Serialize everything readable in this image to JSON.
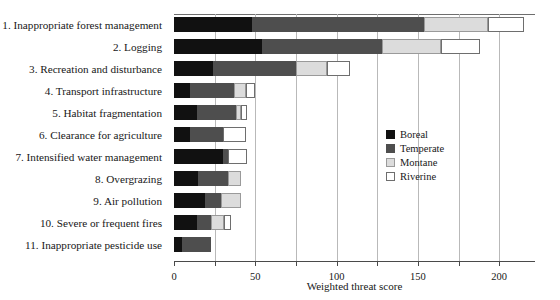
{
  "chart_data": {
    "type": "bar",
    "orientation": "horizontal",
    "stacked": true,
    "title": "",
    "xlabel": "Weighted threat score",
    "ylabel": "",
    "xlim": [
      0,
      222
    ],
    "xticks": [
      0,
      25,
      50,
      75,
      100,
      125,
      150,
      175,
      200
    ],
    "xtick_labels": [
      "0",
      "",
      "50",
      "",
      "100",
      "",
      "150",
      "",
      "200"
    ],
    "grid": "vertical",
    "legend_position": "center-right",
    "categories": [
      "1. Inappropriate forest management",
      "2. Logging",
      "3. Recreation and disturbance",
      "4. Transport infrastructure",
      "5. Habitat fragmentation",
      "6. Clearance for agriculture",
      "7. Intensified water management",
      "8. Overgrazing",
      "9. Air pollution",
      "10. Severe or frequent fires",
      "11. Inappropriate pesticide use"
    ],
    "series": [
      {
        "name": "Boreal",
        "color": "#111111",
        "values": [
          48,
          54,
          24,
          10,
          14,
          10,
          30,
          15,
          19,
          14,
          5
        ]
      },
      {
        "name": "Temperate",
        "color": "#4e4e4e",
        "values": [
          106,
          74,
          51,
          27,
          24,
          20,
          3,
          18,
          10,
          9,
          18
        ]
      },
      {
        "name": "Montane",
        "color": "#dcdcdc",
        "values": [
          39,
          36,
          19,
          7,
          3,
          0,
          0,
          8,
          12,
          8,
          0
        ]
      },
      {
        "name": "Riverine",
        "color": "#ffffff",
        "values": [
          22,
          24,
          14,
          6,
          4,
          14,
          12,
          0,
          0,
          4,
          0
        ]
      }
    ],
    "totals": [
      215,
      188,
      108,
      50,
      45,
      44,
      45,
      41,
      41,
      35,
      23
    ]
  },
  "legend": {
    "items": [
      {
        "label": "Boreal",
        "swatch": "boreal"
      },
      {
        "label": "Temperate",
        "swatch": "temperate"
      },
      {
        "label": "Montane",
        "swatch": "montane"
      },
      {
        "label": "Riverine",
        "swatch": "riverine"
      }
    ]
  },
  "axis": {
    "xlabel": "Weighted threat score"
  }
}
